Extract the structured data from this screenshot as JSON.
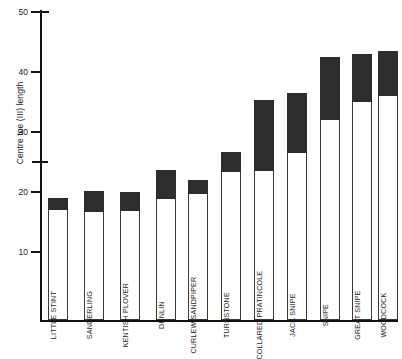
{
  "chart_data": {
    "type": "bar",
    "title": "",
    "subtitle": "",
    "xlabel": "",
    "ylabel": "Centre toe (III) length",
    "ylim": [
      5,
      50
    ],
    "yticks": [
      10,
      20,
      30,
      40,
      50
    ],
    "ytick_labels": [
      "10",
      "20",
      "30",
      "40",
      "50"
    ],
    "extra_tick": 25,
    "grid": false,
    "legend": "none",
    "orientation": "vertical",
    "note": "Each bar is a range bar: white lower portion = minimum, dark upper portion = from split value to maximum",
    "categories": [
      "LITTLE STINT",
      "SANDERLING",
      "KENTISH PLOVER",
      "DUNLIN",
      "CURLEW SANDPIPER",
      "TURNSTONE",
      "COLLARED PRATINCOLE",
      "JACK SNIPE",
      "SNIPE",
      "GREAT SNIPE",
      "WOODCOCK"
    ],
    "series": [
      {
        "name": "minimum",
        "values": [
          17.0,
          16.7,
          16.8,
          18.8,
          19.7,
          23.3,
          23.5,
          26.5,
          32.0,
          35.0,
          36.0
        ]
      },
      {
        "name": "maximum",
        "values": [
          19.0,
          20.2,
          20.0,
          23.7,
          22.0,
          26.7,
          35.3,
          36.5,
          42.5,
          43.0,
          43.5
        ]
      }
    ],
    "groups": [
      {
        "name": "group-left",
        "categories": [
          "LITTLE STINT",
          "SANDERLING",
          "KENTISH PLOVER",
          "DUNLIN"
        ]
      },
      {
        "name": "group-right",
        "categories": [
          "CURLEW SANDPIPER",
          "TURNSTONE",
          "COLLARED PRATINCOLE",
          "JACK SNIPE",
          "SNIPE",
          "GREAT SNIPE",
          "WOODCOCK"
        ]
      }
    ],
    "colors": {
      "bar_fill_light": "#ffffff",
      "bar_fill_dark": "#2e2e2e",
      "bar_outline": "#3a3a3a",
      "axis": "#111111",
      "text": "#1d1d1d",
      "background": "#ffffff"
    }
  }
}
